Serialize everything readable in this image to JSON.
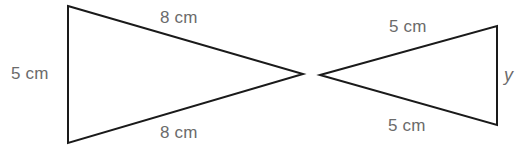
{
  "figure": {
    "background_color": "#ffffff",
    "stroke_color": "#1a1a1a",
    "label_color": "#6b6b6b",
    "stroke_width": 2
  },
  "shapes": {
    "left_triangle": {
      "name": "left-triangle",
      "orientation": "points-right",
      "points": "68,6 303,74 68,143",
      "vertices": [
        {
          "name": "top-left-vertex",
          "x": 68,
          "y": 6
        },
        {
          "name": "right-apex-vertex",
          "x": 303,
          "y": 74
        },
        {
          "name": "bottom-left-vertex",
          "x": 68,
          "y": 143
        }
      ]
    },
    "right_triangle": {
      "name": "right-triangle",
      "orientation": "points-left",
      "points": "320,75 497,26 497,125",
      "vertices": [
        {
          "name": "left-apex-vertex",
          "x": 320,
          "y": 75
        },
        {
          "name": "top-right-vertex",
          "x": 497,
          "y": 26
        },
        {
          "name": "bottom-right-vertex",
          "x": 497,
          "y": 125
        }
      ]
    }
  },
  "labels": {
    "left_triangle_vertical_side": "5 cm",
    "left_triangle_top_side": "8 cm",
    "left_triangle_bottom_side": "8 cm",
    "right_triangle_top_side": "5 cm",
    "right_triangle_bottom_side": "5 cm",
    "right_triangle_vertical_side": "y"
  }
}
